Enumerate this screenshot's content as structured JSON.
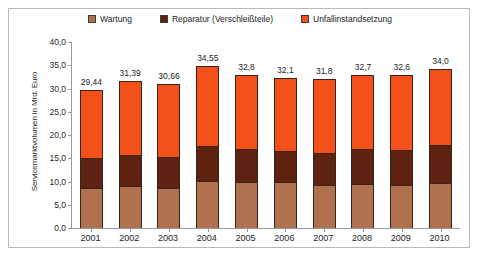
{
  "legend": {
    "position": "top-center",
    "entries": [
      {
        "label": "Wartung",
        "color": "#B0714E",
        "icon": "legend-swatch"
      },
      {
        "label": "Reparatur (Verschleißteile)",
        "color": "#5E2310",
        "icon": "legend-swatch"
      },
      {
        "label": "Unfallinstandsetzung",
        "color": "#F4511A",
        "icon": "legend-swatch"
      }
    ]
  },
  "axis": {
    "y_title": "Servicemarktvolumen in Mrd. Euro",
    "y_ticks": [
      "40,0",
      "35,0",
      "30,0",
      "25,0",
      "20,0",
      "15,0",
      "10,0",
      "5,0",
      "0,0"
    ]
  },
  "chart_data": {
    "type": "bar",
    "stacked": true,
    "title": "",
    "subtitle": "",
    "xlabel": "",
    "ylabel": "Servicemarktvolumen in Mrd. Euro",
    "ylim": [
      0,
      40
    ],
    "ytick_step": 5,
    "grid": false,
    "legend_position": "top-center",
    "categories": [
      "2001",
      "2002",
      "2003",
      "2004",
      "2005",
      "2006",
      "2007",
      "2008",
      "2009",
      "2010"
    ],
    "series": [
      {
        "name": "Wartung",
        "color": "#B0714E",
        "values": [
          8.6,
          9.0,
          8.7,
          10.1,
          9.9,
          9.9,
          9.3,
          9.5,
          9.3,
          9.6
        ]
      },
      {
        "name": "Reparatur (Verschleißteile)",
        "color": "#5E2310",
        "values": [
          6.4,
          6.6,
          6.5,
          7.5,
          7.2,
          6.7,
          6.9,
          7.4,
          7.4,
          8.3
        ]
      },
      {
        "name": "Unfallinstandsetzung",
        "color": "#F4511A",
        "values": [
          14.44,
          15.79,
          15.46,
          16.95,
          15.7,
          15.5,
          15.6,
          15.8,
          15.9,
          16.1
        ]
      }
    ],
    "totals": [
      29.44,
      31.39,
      30.66,
      34.55,
      32.8,
      32.1,
      31.8,
      32.7,
      32.6,
      34.0
    ],
    "total_labels": [
      "29,44",
      "31,39",
      "30,66",
      "34,55",
      "32,8",
      "32,1",
      "31,8",
      "32,7",
      "32,6",
      "34,0"
    ]
  }
}
